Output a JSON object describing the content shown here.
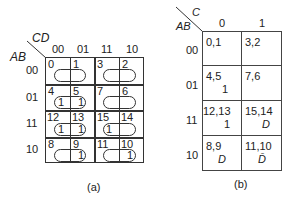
{
  "map_a": {
    "caption": "(a)",
    "col_var": "CD",
    "row_var": "AB",
    "col_headers": [
      "00",
      "01",
      "11",
      "10"
    ],
    "row_headers": [
      "00",
      "01",
      "11",
      "10"
    ],
    "cells": [
      [
        {
          "index": "0",
          "value": ""
        },
        {
          "index": "1",
          "value": ""
        },
        {
          "index": "3",
          "value": ""
        },
        {
          "index": "2",
          "value": ""
        }
      ],
      [
        {
          "index": "4",
          "value": "1"
        },
        {
          "index": "5",
          "value": "1"
        },
        {
          "index": "7",
          "value": ""
        },
        {
          "index": "6",
          "value": ""
        }
      ],
      [
        {
          "index": "12",
          "value": "1"
        },
        {
          "index": "13",
          "value": "1"
        },
        {
          "index": "15",
          "value": "1"
        },
        {
          "index": "14",
          "value": ""
        }
      ],
      [
        {
          "index": "8",
          "value": ""
        },
        {
          "index": "9",
          "value": "1"
        },
        {
          "index": "11",
          "value": ""
        },
        {
          "index": "10",
          "value": "1"
        }
      ]
    ]
  },
  "map_b": {
    "caption": "(b)",
    "col_var": "C",
    "row_var": "AB",
    "col_headers": [
      "0",
      "1"
    ],
    "row_headers": [
      "00",
      "01",
      "11",
      "10"
    ],
    "cells": [
      [
        {
          "indices": "0,1",
          "value": ""
        },
        {
          "indices": "3,2",
          "value": ""
        }
      ],
      [
        {
          "indices": "4,5",
          "value": "1"
        },
        {
          "indices": "7,6",
          "value": ""
        }
      ],
      [
        {
          "indices": "12,13",
          "value": "1"
        },
        {
          "indices": "15,14",
          "value": "D"
        }
      ],
      [
        {
          "indices": "8,9",
          "value": "D"
        },
        {
          "indices": "11,10",
          "value": "D̄"
        }
      ]
    ]
  }
}
